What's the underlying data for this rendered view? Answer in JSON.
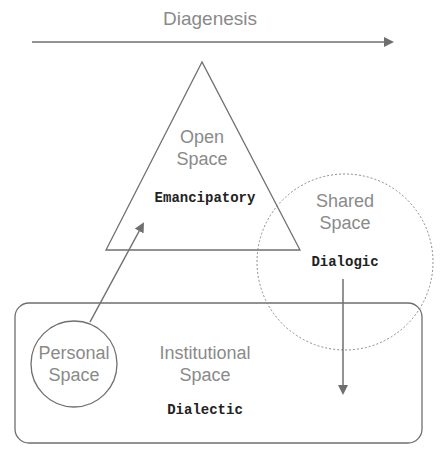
{
  "axis": {
    "label": "Diagenesis"
  },
  "shapes": {
    "open": {
      "title_1": "Open",
      "title_2": "Space",
      "mode": "Emancipatory"
    },
    "shared": {
      "title_1": "Shared",
      "title_2": "Space",
      "mode": "Dialogic"
    },
    "personal": {
      "title_1": "Personal",
      "title_2": "Space"
    },
    "institutional": {
      "title_1": "Institutional",
      "title_2": "Space",
      "mode": "Dialectic"
    }
  },
  "colors": {
    "line": "#6f6f6f",
    "text": "#8a8a8a",
    "mono": "#222222"
  }
}
